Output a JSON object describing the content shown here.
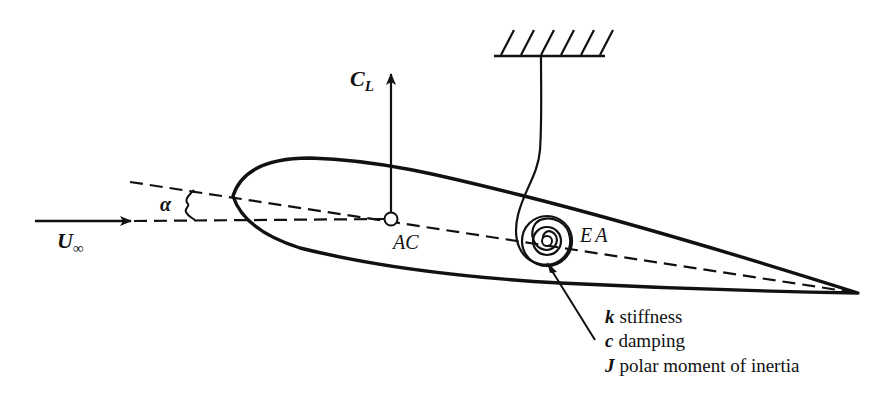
{
  "figure": {
    "type": "airfoil-aeroelastic-schematic",
    "labels": {
      "lift_coefficient": "C",
      "lift_coefficient_sub": "L",
      "freestream": "U",
      "freestream_sub": "∞",
      "angle_of_attack": "α",
      "aerodynamic_center": "AC",
      "elastic_axis": "EA"
    },
    "legend": [
      {
        "symbol": "k",
        "text": "stiffness"
      },
      {
        "symbol": "c",
        "text": "damping"
      },
      {
        "symbol": "J",
        "text": "polar moment of inertia"
      }
    ],
    "colors": {
      "stroke": "#111111",
      "background": "#ffffff"
    }
  }
}
